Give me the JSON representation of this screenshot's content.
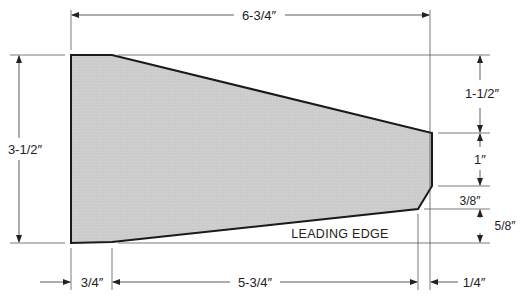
{
  "diagram": {
    "shape_label": "LEADING EDGE",
    "fill_color": "#c9c9c9",
    "stroke_color": "#1a1a1a",
    "dimensions": {
      "overall_length": "6-3/4″",
      "overall_height": "3-1/2″",
      "right_top_offset": "1-1/2″",
      "right_flat": "1″",
      "right_bevel_height": "3/8″",
      "right_bottom_offset": "5/8″",
      "bottom_left_offset": "3/4″",
      "bottom_span": "5-3/4″",
      "bottom_right_bevel": "1/4″"
    }
  }
}
